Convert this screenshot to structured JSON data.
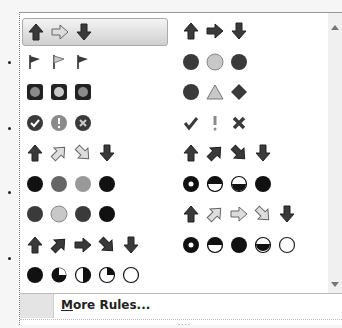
{
  "gallery": {
    "title": "Icon Sets",
    "left_column": [
      {
        "name": "3-arrows-colored",
        "icons": [
          "arrow-up-dark",
          "arrow-right-outline",
          "arrow-down-dark"
        ],
        "selected": true
      },
      {
        "name": "3-flags",
        "icons": [
          "flag-dark",
          "flag-light",
          "flag-dark"
        ]
      },
      {
        "name": "3-traffic-lights-rimmed",
        "icons": [
          "light-square-dark",
          "light-square-mid",
          "light-square-dark"
        ]
      },
      {
        "name": "3-symbols-circled",
        "icons": [
          "check-circle",
          "exclaim-circle",
          "x-circle"
        ]
      },
      {
        "name": "4-arrows-gray",
        "icons": [
          "arrow-up-dark",
          "arrow-upright-outline",
          "arrow-downright-outline",
          "arrow-down-dark"
        ]
      },
      {
        "name": "4-red-to-black",
        "icons": [
          "circle-black",
          "circle-gray",
          "circle-lightgray",
          "circle-black"
        ]
      },
      {
        "name": "4-traffic-lights",
        "icons": [
          "circle-dark",
          "circle-light",
          "circle-dark",
          "circle-black"
        ]
      },
      {
        "name": "5-arrows-colored",
        "icons": [
          "arrow-up-dark",
          "arrow-upright-dark",
          "arrow-right-dark",
          "arrow-downright-dark",
          "arrow-down-dark"
        ]
      },
      {
        "name": "5-quarters",
        "icons": [
          "pie-full",
          "pie-3q",
          "pie-half",
          "pie-1q",
          "pie-empty"
        ]
      }
    ],
    "right_column": [
      {
        "name": "3-arrows-gray",
        "icons": [
          "arrow-up-dark",
          "arrow-right-dark",
          "arrow-down-dark"
        ]
      },
      {
        "name": "3-traffic-lights-unrimmed",
        "icons": [
          "circle-dark",
          "circle-light",
          "circle-dark"
        ]
      },
      {
        "name": "3-signs",
        "icons": [
          "circle-dark",
          "triangle-light",
          "diamond-dark"
        ]
      },
      {
        "name": "3-symbols-uncircled",
        "icons": [
          "check",
          "exclaim",
          "x"
        ]
      },
      {
        "name": "4-arrows-colored",
        "icons": [
          "arrow-up-dark",
          "arrow-upright-dark",
          "arrow-downright-dark",
          "arrow-down-dark"
        ]
      },
      {
        "name": "4-ratings",
        "icons": [
          "ring-black",
          "half-top-white",
          "half-bottom-white",
          "circle-black"
        ]
      },
      {
        "name": "5-arrows-gray",
        "icons": [
          "arrow-up-dark",
          "arrow-upright-outline",
          "arrow-right-outline",
          "arrow-downright-outline",
          "arrow-down-dark"
        ]
      },
      {
        "name": "5-ratings",
        "icons": [
          "ring-black",
          "half-top-white",
          "circle-black",
          "half-bottom-black",
          "circle-empty"
        ]
      }
    ]
  },
  "footer": {
    "more_rules_mnemonic": "M",
    "more_rules_rest": "ore Rules..."
  },
  "grip": "....",
  "colors": {
    "dark": "#3a3a3a",
    "mid": "#8a8a8a",
    "light": "#c8c8c8"
  }
}
